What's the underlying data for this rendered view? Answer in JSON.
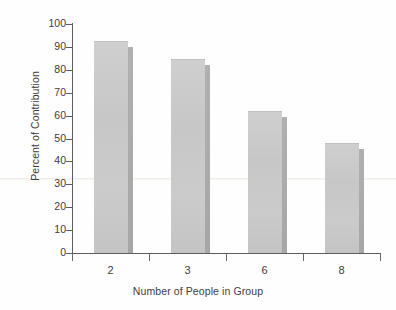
{
  "chart_data": {
    "type": "bar",
    "title": "",
    "xlabel": "Number of People in Group",
    "ylabel": "Percent of Contribution",
    "categories": [
      "2",
      "3",
      "6",
      "8"
    ],
    "values": [
      92,
      84.5,
      61.5,
      47.5
    ],
    "series": [
      {
        "name": "Percent of Contribution",
        "values": [
          92,
          84.5,
          61.5,
          47.5
        ]
      }
    ],
    "ylim": [
      0,
      100
    ],
    "ytick_labels": [
      "100",
      "90",
      "80",
      "70",
      "60",
      "50",
      "40",
      "30",
      "20",
      "10",
      "0"
    ],
    "ytick_values": [
      100,
      90,
      80,
      70,
      60,
      50,
      40,
      30,
      20,
      10,
      0
    ],
    "xtick_labels": [
      "2",
      "3",
      "6",
      "8"
    ],
    "grid": false,
    "legend": "none",
    "bar_color": "#c9c9c9",
    "bar_shadow_color": "#a9a9a9",
    "axis_color": "#5d5d5d",
    "background_color": "#ffffff"
  },
  "axes": {
    "y_title": "Percent of Contribution",
    "x_title": "Number of People in Group"
  }
}
